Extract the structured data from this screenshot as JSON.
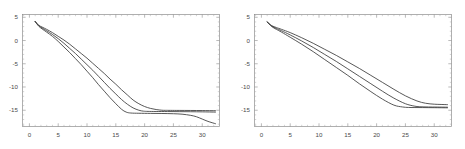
{
  "figure": {
    "background_color": "#ffffff",
    "frame_color": "#8d8d8d",
    "curve_color": "#3a3a3a",
    "panel_count": 2
  },
  "chart_data": [
    {
      "type": "line",
      "title": "",
      "subtitle": "",
      "xlabel": "",
      "ylabel": "",
      "xlim": [
        -1.2,
        33.0
      ],
      "ylim": [
        -18.5,
        5.6
      ],
      "xticks": [
        0,
        5,
        10,
        15,
        20,
        25,
        30
      ],
      "xtick_labels": [
        "0",
        "5",
        "10",
        "15",
        "20",
        "25",
        "30"
      ],
      "yticks": [
        5,
        0,
        -5,
        -10,
        -15
      ],
      "ytick_labels": [
        "5",
        "0",
        "-5",
        "-10",
        "-15"
      ],
      "grid": false,
      "legend": false,
      "legend_position": "none",
      "frame": true,
      "series": [
        {
          "name": "curve-upper",
          "x": [
            1.0,
            1.6,
            2.2,
            3.0,
            4.0,
            5.0,
            6.0,
            7.0,
            8.0,
            9.0,
            10.0,
            11.0,
            12.0,
            13.0,
            14.0,
            15.0,
            16.0,
            17.0,
            18.0,
            19.0,
            20.0,
            21.0,
            22.0,
            23.0,
            23.6,
            24.5,
            26.0,
            28.0,
            30.0,
            32.3
          ],
          "y": [
            4.1,
            3.3,
            2.9,
            2.4,
            1.7,
            0.9,
            0.1,
            -0.8,
            -1.8,
            -2.8,
            -3.8,
            -4.9,
            -6.0,
            -7.1,
            -8.3,
            -9.4,
            -10.6,
            -11.7,
            -12.8,
            -13.6,
            -14.2,
            -14.6,
            -14.85,
            -15.0,
            -15.02,
            -15.03,
            -15.04,
            -15.05,
            -15.07,
            -15.1
          ]
        },
        {
          "name": "curve-middle",
          "x": [
            1.0,
            1.6,
            2.2,
            3.0,
            4.0,
            5.0,
            6.0,
            7.0,
            8.0,
            9.0,
            10.0,
            11.0,
            12.0,
            13.0,
            14.0,
            15.0,
            16.0,
            17.0,
            18.0,
            19.0,
            19.8,
            20.6,
            22.0,
            24.0,
            26.0,
            28.0,
            30.0,
            32.3
          ],
          "y": [
            4.1,
            3.2,
            2.7,
            2.1,
            1.3,
            0.4,
            -0.6,
            -1.7,
            -2.8,
            -4.0,
            -5.2,
            -6.4,
            -7.7,
            -9.0,
            -10.3,
            -11.5,
            -12.7,
            -13.7,
            -14.5,
            -15.0,
            -15.2,
            -15.25,
            -15.27,
            -15.28,
            -15.3,
            -15.32,
            -15.35,
            -15.4
          ]
        },
        {
          "name": "curve-lower",
          "x": [
            1.0,
            1.6,
            2.2,
            3.0,
            4.0,
            5.0,
            6.0,
            7.0,
            8.0,
            9.0,
            10.0,
            11.0,
            12.0,
            13.0,
            14.0,
            15.0,
            16.0,
            16.8,
            17.6,
            19.0,
            21.0,
            23.0,
            25.0,
            26.5,
            28.0,
            29.0,
            30.0,
            31.0,
            32.3
          ],
          "y": [
            4.1,
            3.1,
            2.5,
            1.8,
            0.9,
            -0.2,
            -1.4,
            -2.6,
            -3.9,
            -5.2,
            -6.6,
            -8.0,
            -9.5,
            -10.9,
            -12.3,
            -13.6,
            -14.8,
            -15.4,
            -15.6,
            -15.65,
            -15.68,
            -15.7,
            -15.75,
            -15.85,
            -16.1,
            -16.4,
            -16.9,
            -17.4,
            -17.9
          ]
        }
      ]
    },
    {
      "type": "line",
      "title": "",
      "subtitle": "",
      "xlabel": "",
      "ylabel": "",
      "xlim": [
        -1.2,
        33.0
      ],
      "ylim": [
        -18.5,
        5.6
      ],
      "xticks": [
        0,
        5,
        10,
        15,
        20,
        25,
        30
      ],
      "xtick_labels": [
        "0",
        "5",
        "10",
        "15",
        "20",
        "25",
        "30"
      ],
      "yticks": [
        5,
        0,
        -5,
        -10,
        -15
      ],
      "ytick_labels": [
        "5",
        "0",
        "-5",
        "-10",
        "-15"
      ],
      "grid": false,
      "legend": false,
      "legend_position": "none",
      "frame": true,
      "series": [
        {
          "name": "curve-upper",
          "x": [
            1.0,
            1.8,
            2.6,
            3.5,
            5.0,
            7.0,
            9.0,
            11.0,
            13.0,
            15.0,
            17.0,
            19.0,
            21.0,
            23.0,
            25.0,
            27.0,
            28.5,
            30.0,
            31.0,
            32.3
          ],
          "y": [
            4.0,
            3.2,
            2.8,
            2.4,
            1.7,
            0.6,
            -0.6,
            -1.9,
            -3.2,
            -4.6,
            -6.0,
            -7.5,
            -9.0,
            -10.5,
            -11.9,
            -13.0,
            -13.5,
            -13.7,
            -13.75,
            -13.8
          ]
        },
        {
          "name": "curve-middle",
          "x": [
            1.0,
            1.8,
            2.6,
            3.5,
            5.0,
            7.0,
            9.0,
            11.0,
            13.0,
            15.0,
            17.0,
            19.0,
            21.0,
            23.0,
            25.0,
            26.5,
            27.5,
            29.0,
            30.5,
            32.3
          ],
          "y": [
            4.0,
            3.1,
            2.6,
            2.1,
            1.2,
            -0.1,
            -1.5,
            -3.0,
            -4.5,
            -6.1,
            -7.7,
            -9.3,
            -10.9,
            -12.4,
            -13.6,
            -14.1,
            -14.25,
            -14.3,
            -14.32,
            -14.35
          ]
        },
        {
          "name": "curve-lower",
          "x": [
            1.0,
            1.8,
            2.6,
            3.5,
            5.0,
            7.0,
            9.0,
            11.0,
            13.0,
            15.0,
            17.0,
            19.0,
            21.0,
            23.0,
            24.5,
            25.5,
            26.5,
            28.0,
            30.0,
            32.3
          ],
          "y": [
            4.0,
            3.0,
            2.4,
            1.8,
            0.7,
            -0.8,
            -2.4,
            -4.1,
            -5.8,
            -7.5,
            -9.3,
            -11.0,
            -12.6,
            -13.9,
            -14.3,
            -14.4,
            -14.42,
            -14.43,
            -14.45,
            -14.48
          ]
        }
      ]
    }
  ]
}
